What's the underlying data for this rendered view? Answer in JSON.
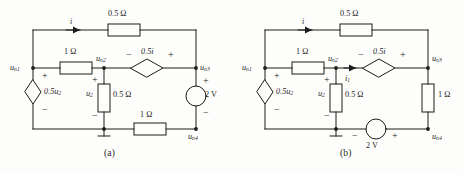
{
  "figure": {
    "type": "electrical-circuit-diagram",
    "background_color": "#fdfdfb",
    "line_color": "#1d1d1d",
    "panels": [
      {
        "caption": "(a)",
        "nodes": [
          {
            "id": "n1",
            "label": "u",
            "subscript": "n1"
          },
          {
            "id": "n2",
            "label": "u",
            "subscript": "n2"
          },
          {
            "id": "n3",
            "label": "u",
            "subscript": "n3"
          },
          {
            "id": "n4",
            "label": "u",
            "subscript": "n4"
          }
        ],
        "currents": [
          {
            "name": "i",
            "label": "i",
            "location": "top-branch"
          }
        ],
        "components": [
          {
            "kind": "resistor",
            "value": "0.5",
            "unit": "Ω",
            "label": "0.5 Ω",
            "placement": "top-horizontal"
          },
          {
            "kind": "resistor",
            "value": "1",
            "unit": "Ω",
            "label": "1 Ω",
            "placement": "middle-left-horizontal"
          },
          {
            "kind": "resistor",
            "value": "0.5",
            "unit": "Ω",
            "label": "0.5 Ω",
            "placement": "middle-vertical"
          },
          {
            "kind": "resistor",
            "value": "1",
            "unit": "Ω",
            "label": "1 Ω",
            "placement": "bottom-horizontal"
          },
          {
            "kind": "dependent-source-diamond",
            "label": "0.5u",
            "subscript": "2",
            "orientation": "vertical",
            "placement": "left-branch",
            "plus": "+",
            "minus": "−"
          },
          {
            "kind": "dependent-source-diamond",
            "label": "0.5i",
            "orientation": "horizontal",
            "placement": "middle-right-horizontal",
            "plus": "+",
            "minus": "−"
          },
          {
            "kind": "independent-voltage-source-circle",
            "label": "2 V",
            "orientation": "vertical",
            "placement": "right-branch",
            "plus": "+",
            "minus": "−"
          }
        ],
        "voltage_labels": [
          {
            "label": "u",
            "subscript": "2",
            "plus": "+",
            "minus": "−"
          }
        ],
        "ground": {
          "present": true,
          "at": "bottom-middle-node"
        }
      },
      {
        "caption": "(b)",
        "nodes": [
          {
            "id": "n1",
            "label": "u",
            "subscript": "n1"
          },
          {
            "id": "n2",
            "label": "u",
            "subscript": "n2"
          },
          {
            "id": "n3",
            "label": "u",
            "subscript": "n3"
          },
          {
            "id": "n4",
            "label": "u",
            "subscript": "n4"
          }
        ],
        "currents": [
          {
            "name": "i",
            "label": "i",
            "location": "top-branch"
          },
          {
            "name": "i1",
            "label": "i",
            "subscript": "1",
            "location": "middle-right-branch"
          }
        ],
        "components": [
          {
            "kind": "resistor",
            "value": "0.5",
            "unit": "Ω",
            "label": "0.5 Ω",
            "placement": "top-horizontal"
          },
          {
            "kind": "resistor",
            "value": "1",
            "unit": "Ω",
            "label": "1 Ω",
            "placement": "middle-left-horizontal"
          },
          {
            "kind": "resistor",
            "value": "0.5",
            "unit": "Ω",
            "label": "0.5 Ω",
            "placement": "middle-vertical"
          },
          {
            "kind": "resistor",
            "value": "1",
            "unit": "Ω",
            "label": "1 Ω",
            "placement": "right-vertical"
          },
          {
            "kind": "dependent-source-diamond",
            "label": "0.5u",
            "subscript": "2",
            "orientation": "vertical",
            "placement": "left-branch",
            "plus": "+",
            "minus": "−"
          },
          {
            "kind": "dependent-source-diamond",
            "label": "0.5i",
            "orientation": "horizontal",
            "placement": "middle-right-horizontal",
            "plus": "+",
            "minus": "−"
          },
          {
            "kind": "independent-voltage-source-circle",
            "label": "2 V",
            "orientation": "horizontal",
            "placement": "bottom-horizontal",
            "minus": "−",
            "plus": "+"
          }
        ],
        "voltage_labels": [
          {
            "label": "u",
            "subscript": "2",
            "plus": "+",
            "minus": "−"
          }
        ],
        "ground": {
          "present": true,
          "at": "bottom-middle-node"
        }
      }
    ],
    "symbols": {
      "plus": "+",
      "minus": "−",
      "ohm": "Ω"
    }
  }
}
